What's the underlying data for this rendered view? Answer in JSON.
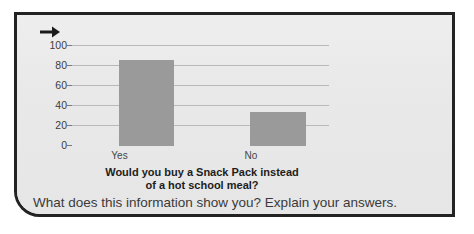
{
  "panel": {
    "arrow_icon": "arrow-right-icon",
    "background_color": "#e9e9e9",
    "border_color": "#232323"
  },
  "question": "What does this information show you? Explain your answers.",
  "chart_data": {
    "type": "bar",
    "title": "Would you buy a Snack Pack instead of a hot school meal?",
    "title_line1": "Would you buy a Snack Pack instead",
    "title_line2": "of a hot school meal?",
    "categories": [
      "Yes",
      "No"
    ],
    "values": [
      85,
      34
    ],
    "xlabel": "",
    "ylabel": "",
    "ylim": [
      0,
      100
    ],
    "yticks": [
      0,
      20,
      40,
      60,
      80,
      100
    ],
    "ytick_labels": [
      "0",
      "20",
      "40",
      "60",
      "80",
      "100"
    ],
    "grid": true,
    "legend": "none",
    "bar_color": "#9a9a9a",
    "gridline_color": "#b9b9b9",
    "axis_color": "#6f6f6f"
  }
}
